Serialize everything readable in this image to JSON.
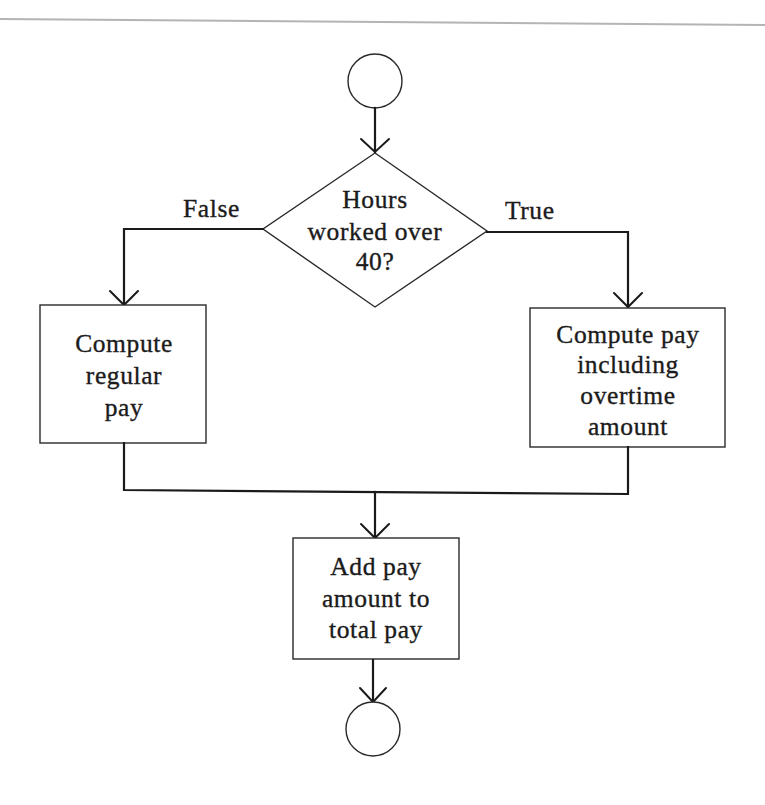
{
  "flowchart": {
    "title": "Overtime pay decision flowchart",
    "start": {
      "shape": "circle",
      "label": ""
    },
    "decision": {
      "shape": "diamond",
      "lines": [
        "Hours",
        "worked over",
        "40?"
      ]
    },
    "branches": {
      "false_label": "False",
      "true_label": "True"
    },
    "false_process": {
      "shape": "rectangle",
      "lines": [
        "Compute",
        "regular",
        "pay"
      ]
    },
    "true_process": {
      "shape": "rectangle",
      "lines": [
        "Compute pay",
        "including",
        "overtime",
        "amount"
      ]
    },
    "merge_process": {
      "shape": "rectangle",
      "lines": [
        "Add pay",
        "amount to",
        "total pay"
      ]
    },
    "end": {
      "shape": "circle",
      "label": ""
    },
    "edges": [
      {
        "from": "start",
        "to": "decision"
      },
      {
        "from": "decision",
        "to": "false_process",
        "label": "False"
      },
      {
        "from": "decision",
        "to": "true_process",
        "label": "True"
      },
      {
        "from": "false_process",
        "to": "merge_process"
      },
      {
        "from": "true_process",
        "to": "merge_process"
      },
      {
        "from": "merge_process",
        "to": "end"
      }
    ]
  },
  "colors": {
    "line": "#1a1a1a",
    "background": "#ffffff",
    "page_rule": "#b4b4b4"
  }
}
